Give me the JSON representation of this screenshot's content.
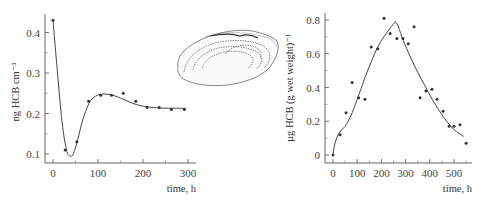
{
  "chart_data": [
    {
      "type": "scatter",
      "title": "",
      "xlabel": "time, h",
      "ylabel": "ng HCB cm⁻³",
      "xlim": [
        0,
        300
      ],
      "ylim": [
        0.08,
        0.45
      ],
      "xticks": [
        "0",
        "100",
        "200",
        "300"
      ],
      "yticks": [
        "0.1",
        "0.2",
        "0.3",
        "0.4"
      ],
      "grid": false,
      "legend": null,
      "series": [
        {
          "name": "measured",
          "marker": "dot",
          "x": [
            0,
            27,
            53,
            79,
            106,
            130,
            156,
            184,
            209,
            236,
            263,
            292
          ],
          "y": [
            0.43,
            0.11,
            0.13,
            0.23,
            0.245,
            0.245,
            0.25,
            0.23,
            0.215,
            0.215,
            0.21,
            0.21
          ]
        },
        {
          "name": "model fit",
          "line": "solid",
          "x": [
            0,
            10,
            20,
            30,
            38,
            45,
            55,
            65,
            80,
            95,
            110,
            130,
            150,
            175,
            200,
            230,
            260,
            295
          ],
          "y": [
            0.43,
            0.3,
            0.18,
            0.11,
            0.095,
            0.1,
            0.135,
            0.18,
            0.225,
            0.243,
            0.248,
            0.246,
            0.238,
            0.226,
            0.218,
            0.214,
            0.213,
            0.213
          ]
        }
      ]
    },
    {
      "type": "scatter",
      "title": "",
      "xlabel": "time, h",
      "ylabel": "µg HCB (g wet weight)⁻¹",
      "xlim": [
        0,
        560
      ],
      "ylim": [
        0,
        0.85
      ],
      "xticks": [
        "0",
        "100",
        "200",
        "300",
        "400",
        "500"
      ],
      "yticks": [
        "0",
        "0.2",
        "0.4",
        "0.6",
        "0.8"
      ],
      "grid": false,
      "legend": null,
      "series": [
        {
          "name": "measured",
          "marker": "dot",
          "x": [
            0,
            29,
            54,
            79,
            106,
            132,
            158,
            185,
            211,
            236,
            264,
            289,
            311,
            335,
            360,
            384,
            409,
            430,
            455,
            480,
            500,
            525,
            550
          ],
          "y": [
            0,
            0.12,
            0.25,
            0.43,
            0.34,
            0.33,
            0.64,
            0.63,
            0.81,
            0.72,
            0.69,
            0.69,
            0.66,
            0.76,
            0.34,
            0.38,
            0.39,
            0.33,
            0.26,
            0.17,
            0.17,
            0.18,
            0.07
          ]
        },
        {
          "name": "model fit",
          "line": "solid",
          "x": [
            0,
            5,
            15,
            30,
            50,
            70,
            90,
            110,
            135,
            160,
            185,
            210,
            235,
            258,
            270,
            290,
            320,
            350,
            380,
            410,
            440,
            470,
            500,
            540
          ],
          "y": [
            0,
            0.05,
            0.1,
            0.14,
            0.17,
            0.22,
            0.29,
            0.37,
            0.47,
            0.56,
            0.64,
            0.7,
            0.75,
            0.79,
            0.76,
            0.68,
            0.58,
            0.49,
            0.41,
            0.33,
            0.26,
            0.2,
            0.15,
            0.11
          ]
        }
      ]
    }
  ],
  "illustration": {
    "name": "clam-shell-drawing"
  }
}
